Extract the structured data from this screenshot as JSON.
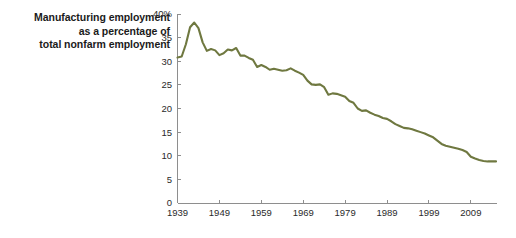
{
  "chart_data": {
    "type": "line",
    "title": "Manufacturing employment as a percentage of total nonfarm employment",
    "title_lines": [
      "Manufacturing employment",
      "as a percentage of",
      "total nonfarm employment"
    ],
    "xlabel": "",
    "ylabel": "",
    "ylim": [
      0,
      40
    ],
    "xlim": [
      1939,
      2015
    ],
    "ytick_labels": [
      "0",
      "5",
      "10",
      "15",
      "20",
      "25",
      "30",
      "35",
      "40%"
    ],
    "ytick_values": [
      0,
      5,
      10,
      15,
      20,
      25,
      30,
      35,
      40
    ],
    "xtick_labels": [
      "1939",
      "1949",
      "1959",
      "1969",
      "1979",
      "1989",
      "1999",
      "2009"
    ],
    "xtick_values": [
      1939,
      1949,
      1959,
      1969,
      1979,
      1989,
      1999,
      2009
    ],
    "grid": false,
    "legend": false,
    "line_color": "#6f7840",
    "series": [
      {
        "name": "Manufacturing share of nonfarm employment",
        "x": [
          1939,
          1940,
          1941,
          1942,
          1943,
          1944,
          1945,
          1946,
          1947,
          1948,
          1949,
          1950,
          1951,
          1952,
          1953,
          1954,
          1955,
          1956,
          1957,
          1958,
          1959,
          1960,
          1961,
          1962,
          1963,
          1964,
          1965,
          1966,
          1967,
          1968,
          1969,
          1970,
          1971,
          1972,
          1973,
          1974,
          1975,
          1976,
          1977,
          1978,
          1979,
          1980,
          1981,
          1982,
          1983,
          1984,
          1985,
          1986,
          1987,
          1988,
          1989,
          1990,
          1991,
          1992,
          1993,
          1994,
          1995,
          1996,
          1997,
          1998,
          1999,
          2000,
          2001,
          2002,
          2003,
          2004,
          2005,
          2006,
          2007,
          2008,
          2009,
          2010,
          2011,
          2012,
          2013,
          2014,
          2015
        ],
        "values": [
          30.8,
          31.0,
          33.6,
          37.2,
          38.2,
          37.0,
          34.0,
          32.2,
          32.6,
          32.3,
          31.3,
          31.7,
          32.5,
          32.3,
          32.8,
          31.2,
          31.2,
          30.7,
          30.3,
          28.8,
          29.2,
          28.8,
          28.2,
          28.4,
          28.2,
          28.0,
          28.1,
          28.5,
          28.0,
          27.6,
          27.1,
          25.9,
          25.1,
          25.0,
          25.1,
          24.5,
          22.9,
          23.2,
          23.1,
          22.8,
          22.5,
          21.6,
          21.2,
          20.0,
          19.5,
          19.6,
          19.1,
          18.7,
          18.4,
          18.0,
          17.8,
          17.3,
          16.7,
          16.3,
          15.9,
          15.8,
          15.6,
          15.3,
          15.0,
          14.7,
          14.3,
          13.9,
          13.2,
          12.5,
          12.1,
          11.9,
          11.7,
          11.5,
          11.2,
          10.8,
          9.8,
          9.4,
          9.1,
          8.9,
          8.8,
          8.8,
          8.8
        ]
      }
    ]
  },
  "axis": {
    "y_axis_name": "y-axis",
    "x_axis_name": "x-axis"
  }
}
